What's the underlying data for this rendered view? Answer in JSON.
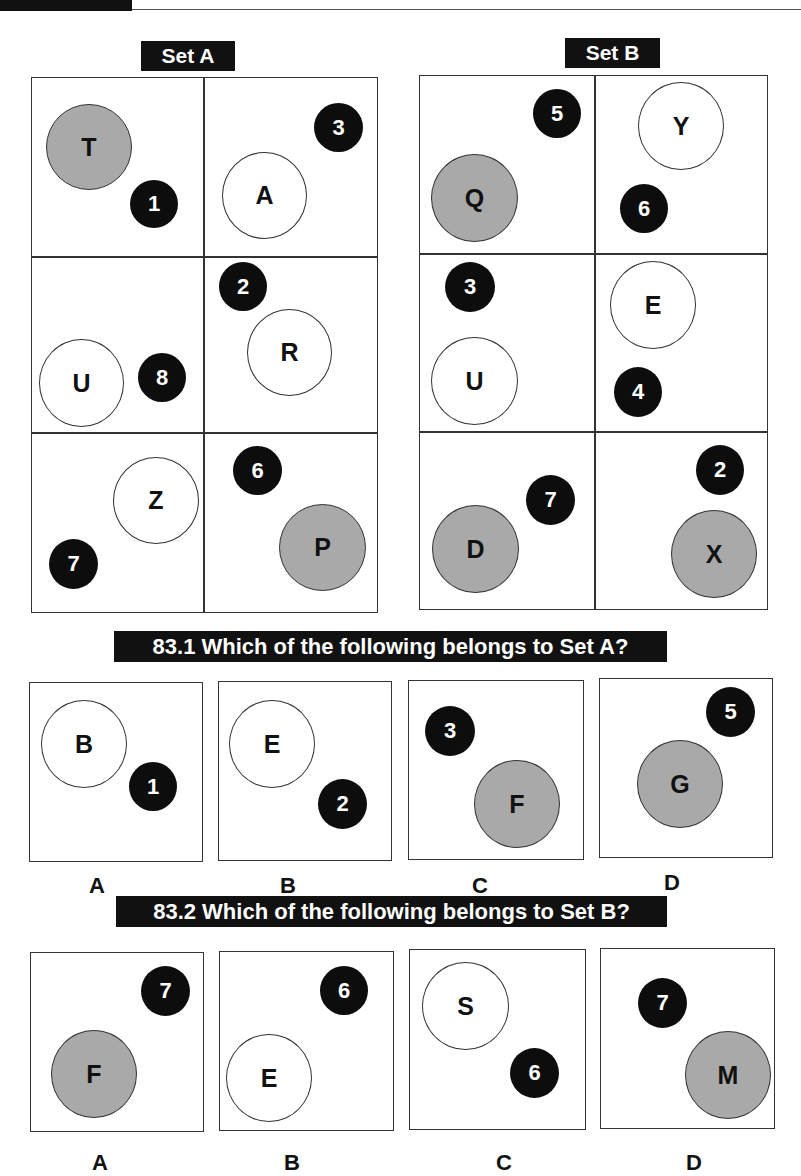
{
  "sets": {
    "set_a": {
      "label": "Set A",
      "cells": [
        {
          "letter": "T",
          "letter_fill": "grey",
          "number": "1"
        },
        {
          "letter": "A",
          "letter_fill": "white",
          "number": "3"
        },
        {
          "letter": "U",
          "letter_fill": "white",
          "number": "8"
        },
        {
          "letter": "R",
          "letter_fill": "white",
          "number": "2"
        },
        {
          "letter": "Z",
          "letter_fill": "white",
          "number": "7"
        },
        {
          "letter": "P",
          "letter_fill": "grey",
          "number": "6"
        }
      ]
    },
    "set_b": {
      "label": "Set B",
      "cells": [
        {
          "letter": "Q",
          "letter_fill": "grey",
          "number": "5"
        },
        {
          "letter": "Y",
          "letter_fill": "white",
          "number": "6"
        },
        {
          "letter": "U",
          "letter_fill": "white",
          "number": "3"
        },
        {
          "letter": "E",
          "letter_fill": "white",
          "number": "4"
        },
        {
          "letter": "D",
          "letter_fill": "grey",
          "number": "7"
        },
        {
          "letter": "X",
          "letter_fill": "grey",
          "number": "2"
        }
      ]
    }
  },
  "questions": [
    {
      "title": "83.1 Which of the following belongs to Set A?",
      "options": [
        {
          "label": "A",
          "letter": "B",
          "letter_fill": "white",
          "number": "1"
        },
        {
          "label": "B",
          "letter": "E",
          "letter_fill": "white",
          "number": "2"
        },
        {
          "label": "C",
          "letter": "F",
          "letter_fill": "grey",
          "number": "3"
        },
        {
          "label": "D",
          "letter": "G",
          "letter_fill": "grey",
          "number": "5"
        }
      ]
    },
    {
      "title": "83.2 Which of the following belongs to Set B?",
      "options": [
        {
          "label": "A",
          "letter": "F",
          "letter_fill": "grey",
          "number": "7"
        },
        {
          "label": "B",
          "letter": "E",
          "letter_fill": "white",
          "number": "6"
        },
        {
          "label": "C",
          "letter": "S",
          "letter_fill": "white",
          "number": "6"
        },
        {
          "label": "D",
          "letter": "M",
          "letter_fill": "grey",
          "number": "7"
        }
      ]
    }
  ],
  "colors": {
    "grey_circle": "#a9a9a9",
    "black_badge": "#0d0d0d",
    "label_bg": "#111111",
    "border": "#333333"
  }
}
